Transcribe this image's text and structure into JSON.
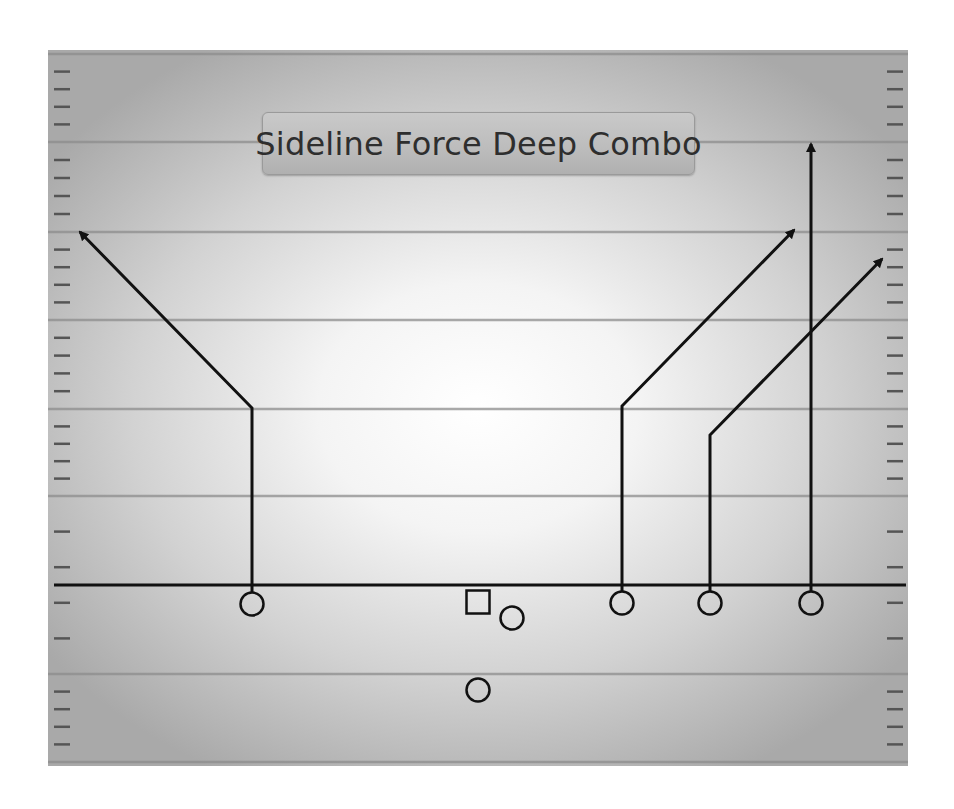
{
  "diagram": {
    "title": "Sideline Force Deep Combo",
    "type": "football-play-diagram",
    "colors": {
      "field_center": "#ffffff",
      "field_edge": "#a9a9a9",
      "yard_line": "#8c8c8c",
      "route": "#111111",
      "title_box": "#c0c0c0",
      "title_text": "#2e2e2e"
    },
    "field": {
      "x": 48,
      "y": 50,
      "width": 860,
      "height": 716
    },
    "line_of_scrimmage_y": 585,
    "yard_lines_y": [
      54,
      142,
      232,
      320,
      409,
      496,
      674,
      762
    ],
    "hash_spacing": 17.7,
    "players": [
      {
        "id": "wr-left",
        "shape": "circle",
        "x": 252,
        "y": 604
      },
      {
        "id": "center",
        "shape": "square",
        "x": 478,
        "y": 602
      },
      {
        "id": "qb",
        "shape": "circle",
        "x": 512,
        "y": 618
      },
      {
        "id": "rb",
        "shape": "circle",
        "x": 478,
        "y": 690
      },
      {
        "id": "wr-slot-1",
        "shape": "circle",
        "x": 622,
        "y": 603
      },
      {
        "id": "wr-slot-2",
        "shape": "circle",
        "x": 710,
        "y": 603
      },
      {
        "id": "wr-right",
        "shape": "circle",
        "x": 811,
        "y": 603
      }
    ],
    "routes": [
      {
        "name": "left-corner-route",
        "points": [
          [
            252,
            592
          ],
          [
            252,
            408
          ],
          [
            80,
            232
          ]
        ]
      },
      {
        "name": "slot-corner-route",
        "points": [
          [
            622,
            591
          ],
          [
            622,
            406
          ],
          [
            794,
            230
          ]
        ]
      },
      {
        "name": "slot-out-corner-route",
        "points": [
          [
            710,
            591
          ],
          [
            710,
            435
          ],
          [
            882,
            259
          ]
        ]
      },
      {
        "name": "go-route",
        "points": [
          [
            811,
            591
          ],
          [
            811,
            144
          ]
        ]
      }
    ]
  }
}
